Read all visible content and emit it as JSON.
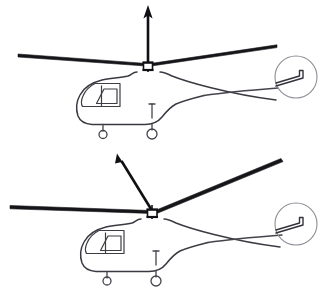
{
  "figure": {
    "title": "",
    "background_color": "#ffffff",
    "line_color": "#3a3a42",
    "blade_color": "#16161a",
    "arrow_color": "#101014",
    "disc_color": "#8e8e96",
    "width": 328,
    "height": 294
  },
  "panels": [
    {
      "id": "panel-top",
      "label": "",
      "description": "Helicopter side view with level rotor disc and vertical thrust vector",
      "rotor_disc_tilt_deg": 0,
      "thrust_vector": {
        "label": "",
        "direction": "vertical-up",
        "angle_from_vertical_deg": 0,
        "tail_x": 148,
        "tail_y": 63,
        "tip_x": 148,
        "tip_y": 6
      },
      "hub": {
        "x": 148,
        "y": 66
      },
      "blade_left_tip": {
        "x": 18,
        "y": 55
      },
      "blade_right_tip": {
        "x": 277,
        "y": 46
      },
      "tail_rotor": {
        "cx": 296,
        "cy": 77,
        "r": 21
      }
    },
    {
      "id": "panel-bottom",
      "label": "",
      "description": "Helicopter side view with rotor disc tilted forward-left and tilted thrust vector",
      "rotor_disc_tilt_deg": 18,
      "thrust_vector": {
        "label": "",
        "direction": "tilted-up-left",
        "angle_from_vertical_deg": 28,
        "tail_x": 152,
        "tail_y": 210,
        "tip_x": 117,
        "tip_y": 153
      },
      "hub": {
        "x": 152,
        "y": 213
      },
      "blade_left_tip": {
        "x": 10,
        "y": 207
      },
      "blade_right_tip": {
        "x": 281,
        "y": 160
      },
      "tail_rotor": {
        "cx": 296,
        "cy": 224,
        "r": 21
      }
    }
  ],
  "components": {
    "main_rotor_blade": "main-rotor-blade",
    "rotor_hub": "rotor-hub",
    "rotor_mast": "rotor-mast",
    "thrust_arrow": "thrust-arrow",
    "fuselage": "fuselage-outline",
    "canopy": "cockpit-canopy",
    "tail_boom": "tail-boom",
    "tail_rotor": "tail-rotor",
    "landing_gear": "landing-gear",
    "wheel": "wheel"
  },
  "captions": {
    "top": "",
    "bottom": ""
  }
}
